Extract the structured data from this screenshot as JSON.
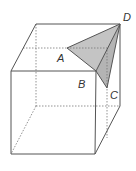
{
  "diagram": {
    "labels": {
      "A": "A",
      "B": "B",
      "C": "C",
      "D": "D"
    },
    "colors": {
      "edge": "#555555",
      "hidden_edge": "#777777",
      "shaded_face": "#c4c4c4",
      "background": "#ffffff"
    }
  }
}
